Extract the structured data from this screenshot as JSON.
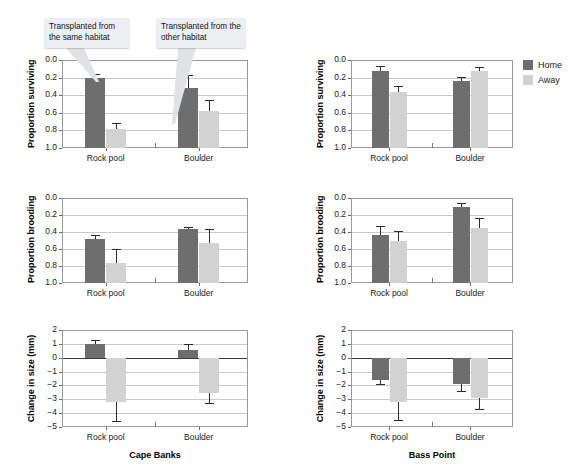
{
  "figure": {
    "legend": {
      "items": [
        {
          "label": "Home",
          "color": "#6e6e6e"
        },
        {
          "label": "Away",
          "color": "#d2d2d2"
        }
      ]
    },
    "callouts": [
      {
        "id": "callout-same-habitat",
        "text": "Transplanted from the same habitat"
      },
      {
        "id": "callout-other-habitat",
        "text": "Transplanted from the other habitat"
      }
    ],
    "columns": [
      {
        "label": "Cape Banks"
      },
      {
        "label": "Bass Point"
      }
    ]
  },
  "chart_data": [
    {
      "id": "cape-banks-surviving",
      "type": "bar",
      "site": "Cape Banks",
      "title": "",
      "xlabel": "Cape Banks",
      "ylabel": "Proportion surviving",
      "categories": [
        "Rock pool",
        "Boulder"
      ],
      "ylim": [
        0.0,
        1.0
      ],
      "yticks": [
        "0.0",
        "0.2",
        "0.4",
        "0.6",
        "0.8",
        "1.0"
      ],
      "grid": true,
      "legend_position": "none",
      "series": [
        {
          "name": "Home",
          "values": [
            0.79,
            0.68
          ],
          "errors": [
            0.05,
            0.15
          ]
        },
        {
          "name": "Away",
          "values": [
            0.22,
            0.42
          ],
          "errors": [
            0.06,
            0.12
          ]
        }
      ]
    },
    {
      "id": "bass-point-surviving",
      "type": "bar",
      "site": "Bass Point",
      "title": "",
      "xlabel": "Bass Point",
      "ylabel": "Proportion surviving",
      "categories": [
        "Rock pool",
        "Boulder"
      ],
      "ylim": [
        0.0,
        1.0
      ],
      "yticks": [
        "0.0",
        "0.2",
        "0.4",
        "0.6",
        "0.8",
        "1.0"
      ],
      "grid": true,
      "legend_position": "right",
      "series": [
        {
          "name": "Home",
          "values": [
            0.88,
            0.76
          ],
          "errors": [
            0.05,
            0.05
          ]
        },
        {
          "name": "Away",
          "values": [
            0.64,
            0.87
          ],
          "errors": [
            0.06,
            0.05
          ]
        }
      ]
    },
    {
      "id": "cape-banks-brooding",
      "type": "bar",
      "site": "Cape Banks",
      "title": "",
      "xlabel": "Cape Banks",
      "ylabel": "Proportion brooding",
      "categories": [
        "Rock pool",
        "Boulder"
      ],
      "ylim": [
        0.0,
        1.0
      ],
      "yticks": [
        "0.0",
        "0.2",
        "0.4",
        "0.6",
        "0.8",
        "1.0"
      ],
      "grid": true,
      "legend_position": "none",
      "series": [
        {
          "name": "Home",
          "values": [
            0.52,
            0.64
          ],
          "errors": [
            0.05,
            0.02
          ]
        },
        {
          "name": "Away",
          "values": [
            0.24,
            0.47
          ],
          "errors": [
            0.16,
            0.16
          ]
        }
      ]
    },
    {
      "id": "bass-point-brooding",
      "type": "bar",
      "site": "Bass Point",
      "title": "",
      "xlabel": "Bass Point",
      "ylabel": "Proportion brooding",
      "categories": [
        "Rock pool",
        "Boulder"
      ],
      "ylim": [
        0.0,
        1.0
      ],
      "yticks": [
        "0.0",
        "0.2",
        "0.4",
        "0.6",
        "0.8",
        "1.0"
      ],
      "grid": true,
      "legend_position": "none",
      "series": [
        {
          "name": "Home",
          "values": [
            0.57,
            0.89
          ],
          "errors": [
            0.1,
            0.05
          ]
        },
        {
          "name": "Away",
          "values": [
            0.49,
            0.65
          ],
          "errors": [
            0.12,
            0.11
          ]
        }
      ]
    },
    {
      "id": "cape-banks-change-in-size",
      "type": "bar",
      "site": "Cape Banks",
      "title": "",
      "xlabel": "Cape Banks",
      "ylabel": "Change in size (mm)",
      "categories": [
        "Rock pool",
        "Boulder"
      ],
      "ylim": [
        -5,
        2
      ],
      "yticks": [
        "2",
        "1",
        "0",
        "−1",
        "−2",
        "−3",
        "−4",
        "−5"
      ],
      "grid": true,
      "legend_position": "none",
      "series": [
        {
          "name": "Home",
          "values": [
            1.0,
            0.55
          ],
          "errors": [
            0.3,
            0.45
          ]
        },
        {
          "name": "Away",
          "values": [
            -3.2,
            -2.55
          ],
          "errors": [
            1.35,
            0.75
          ]
        }
      ]
    },
    {
      "id": "bass-point-change-in-size",
      "type": "bar",
      "site": "Bass Point",
      "title": "",
      "xlabel": "Bass Point",
      "ylabel": "Change in size (mm)",
      "categories": [
        "Rock pool",
        "Boulder"
      ],
      "ylim": [
        -5,
        2
      ],
      "yticks": [
        "2",
        "1",
        "0",
        "−1",
        "−2",
        "−3",
        "−4",
        "−5"
      ],
      "grid": true,
      "legend_position": "none",
      "series": [
        {
          "name": "Home",
          "values": [
            -1.62,
            -1.87
          ],
          "errors": [
            0.28,
            0.5
          ]
        },
        {
          "name": "Away",
          "values": [
            -3.18,
            -2.9
          ],
          "errors": [
            1.35,
            0.82
          ]
        }
      ]
    }
  ]
}
